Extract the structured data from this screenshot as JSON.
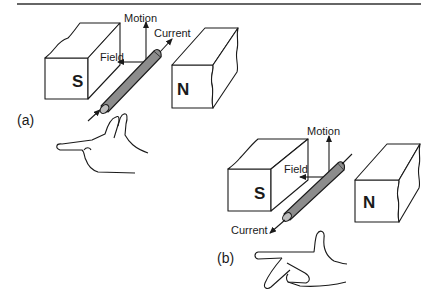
{
  "figure": {
    "panel_a": {
      "label": "(a)",
      "magnets": {
        "south": "S",
        "north": "N"
      },
      "vectors": {
        "motion": "Motion",
        "current": "Current",
        "field": "Field"
      }
    },
    "panel_b": {
      "label": "(b)",
      "magnets": {
        "south": "S",
        "north": "N"
      },
      "vectors": {
        "motion": "Motion",
        "current": "Current",
        "field": "Field"
      }
    },
    "colors": {
      "ink": "#1a1a1a",
      "conductor_fill": "#8c8c8c",
      "background": "#ffffff"
    }
  }
}
